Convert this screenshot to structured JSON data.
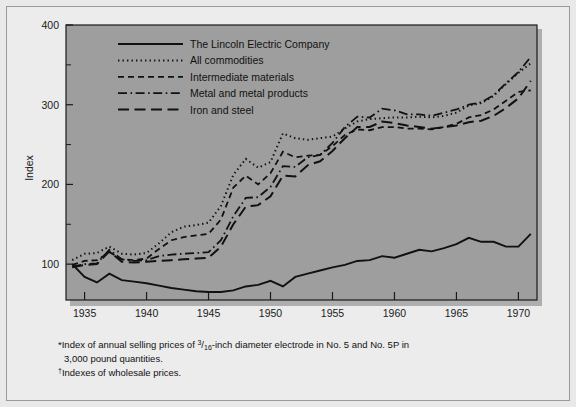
{
  "figure": {
    "background_color": "#e9e9e9",
    "frame_color": "#9a9a9a",
    "plot_background_color": "#9e9e9e",
    "plot_border_color": "#1a1a1a",
    "line_color": "#111111"
  },
  "axes": {
    "y_title": "Index",
    "y_ticks": [
      "100",
      "200",
      "300",
      "400"
    ],
    "y_tick_values": [
      100,
      200,
      300,
      400
    ],
    "y_minor_tick_values": [
      150,
      250,
      350
    ],
    "x_ticks": [
      "1935",
      "1940",
      "1945",
      "1950",
      "1955",
      "1960",
      "1965",
      "1970"
    ],
    "x_tick_values": [
      1935,
      1940,
      1945,
      1950,
      1955,
      1960,
      1965,
      1970
    ]
  },
  "legend": {
    "items": [
      {
        "label": "The Lincoln Electric Company",
        "style": "solid"
      },
      {
        "label": "All commodities",
        "style": "dotted"
      },
      {
        "label": "Intermediate materials",
        "style": "dashed"
      },
      {
        "label": "Metal and metal products",
        "style": "dash-dot"
      },
      {
        "label": "Iron and steel",
        "style": "long-dash"
      }
    ]
  },
  "footnotes": [
    {
      "marker": "*",
      "parts": [
        {
          "text": "Index of annual selling prices of "
        },
        {
          "text": "3",
          "sup": true
        },
        {
          "text": "/"
        },
        {
          "text": "16",
          "sub": true
        },
        {
          "text": "-inch diameter electrode in No. 5 and No. 5P in"
        }
      ],
      "line1": "Index of annual selling prices of 3/16-inch diameter electrode in No. 5 and No. 5P in",
      "line2": "3,000 pound quantities."
    },
    {
      "marker": "†",
      "line1": "Indexes of wholesale prices."
    }
  ],
  "chart_data": {
    "type": "line",
    "title": "",
    "xlabel": "",
    "ylabel": "Index",
    "xlim": [
      1933.5,
      1971.5
    ],
    "ylim": [
      55,
      400
    ],
    "grid": false,
    "legend_position": "top-left-inside",
    "x": [
      1934,
      1935,
      1936,
      1937,
      1938,
      1939,
      1940,
      1941,
      1942,
      1943,
      1944,
      1945,
      1946,
      1947,
      1948,
      1949,
      1950,
      1951,
      1952,
      1953,
      1954,
      1955,
      1956,
      1957,
      1958,
      1959,
      1960,
      1961,
      1962,
      1963,
      1964,
      1965,
      1966,
      1967,
      1968,
      1969,
      1970,
      1971
    ],
    "series": [
      {
        "name": "The Lincoln Electric Company",
        "style": "solid",
        "values": [
          100,
          84,
          77,
          88,
          80,
          78,
          76,
          73,
          70,
          68,
          66,
          65,
          65,
          67,
          72,
          74,
          79,
          72,
          84,
          88,
          92,
          96,
          99,
          104,
          105,
          110,
          108,
          113,
          118,
          116,
          120,
          125,
          133,
          128,
          128,
          122,
          122,
          138
        ]
      },
      {
        "name": "All commodities",
        "style": "dotted",
        "values": [
          105,
          113,
          114,
          122,
          113,
          112,
          114,
          126,
          140,
          147,
          149,
          152,
          173,
          212,
          232,
          221,
          228,
          264,
          258,
          256,
          258,
          260,
          270,
          279,
          282,
          283,
          284,
          284,
          285,
          284,
          286,
          290,
          299,
          302,
          311,
          326,
          340,
          352
        ]
      },
      {
        "name": "Intermediate materials",
        "style": "dashed",
        "values": [
          99,
          104,
          105,
          115,
          106,
          105,
          107,
          119,
          130,
          134,
          136,
          138,
          156,
          196,
          211,
          200,
          214,
          241,
          234,
          236,
          237,
          248,
          262,
          269,
          268,
          272,
          272,
          270,
          270,
          269,
          272,
          276,
          284,
          287,
          294,
          305,
          316,
          318
        ]
      },
      {
        "name": "Metal and metal products",
        "style": "dash-dot",
        "values": [
          97,
          100,
          101,
          118,
          106,
          104,
          105,
          110,
          112,
          113,
          114,
          115,
          130,
          160,
          183,
          184,
          197,
          223,
          222,
          234,
          237,
          252,
          272,
          285,
          284,
          295,
          293,
          288,
          288,
          286,
          290,
          294,
          300,
          303,
          312,
          327,
          341,
          360
        ]
      },
      {
        "name": "Iron and steel",
        "style": "long-dash",
        "values": [
          96,
          99,
          100,
          116,
          103,
          102,
          103,
          104,
          105,
          106,
          107,
          108,
          122,
          150,
          172,
          174,
          185,
          211,
          210,
          224,
          229,
          242,
          258,
          272,
          272,
          279,
          277,
          274,
          272,
          270,
          272,
          274,
          278,
          280,
          286,
          296,
          308,
          330
        ]
      }
    ]
  }
}
